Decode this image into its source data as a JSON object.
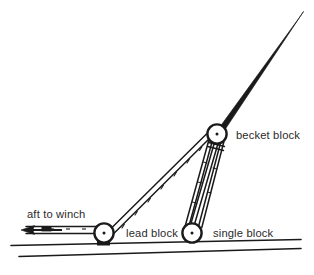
{
  "diagram": {
    "background_color": "#ffffff",
    "ink_color": "#1a1a1a",
    "text_color": "#2b2b2b",
    "labels": {
      "aft_to_winch": "aft to winch",
      "lead_block": "lead block",
      "single_block": "single block",
      "becket_block": "becket block"
    },
    "parts": {
      "spar": "spar",
      "deck_line_upper": "deck line",
      "deck_line_lower": "hull line",
      "hauling_part": "hauling part of line",
      "arrow": "direction arrow pointing aft",
      "standing_part": "standing part to lead block",
      "tackle_falls": "tackle falls between becket block and single block"
    },
    "blocks": [
      {
        "name": "lead block",
        "cx": 104,
        "cy": 233,
        "r": 9.5
      },
      {
        "name": "single block",
        "cx": 192,
        "cy": 233,
        "r": 9.5
      },
      {
        "name": "becket block",
        "cx": 217,
        "cy": 134,
        "r": 9.5
      }
    ]
  }
}
